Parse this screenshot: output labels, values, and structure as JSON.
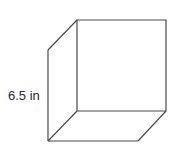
{
  "diagram": {
    "type": "cube",
    "edge_label": "6.5 in",
    "edge_length_value": 6.5,
    "edge_length_unit": "in",
    "stroke_color": "#4a4a4a",
    "background_color": "#ffffff"
  }
}
